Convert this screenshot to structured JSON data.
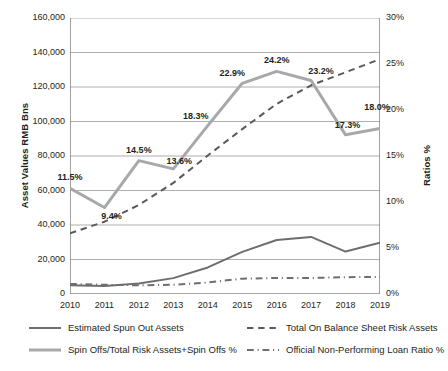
{
  "chart_data": {
    "type": "line",
    "title": "",
    "xlabel": "",
    "categories": [
      "2010",
      "2011",
      "2012",
      "2013",
      "2014",
      "2015",
      "2016",
      "2017",
      "2018",
      "2019"
    ],
    "grid": true,
    "legend_position": "bottom",
    "axes": {
      "left": {
        "label": "Asset Values RMB Bns",
        "ticks": [
          "0",
          "20,000",
          "40,000",
          "60,000",
          "80,000",
          "100,000",
          "120,000",
          "140,000",
          "160,000"
        ],
        "tick_values": [
          0,
          20000,
          40000,
          60000,
          80000,
          100000,
          120000,
          140000,
          160000
        ],
        "ylim": [
          0,
          160000
        ]
      },
      "right": {
        "label": "Ratios %",
        "ticks": [
          "0%",
          "5%",
          "10%",
          "15%",
          "20%",
          "25%",
          "30%"
        ],
        "tick_values": [
          0,
          5,
          10,
          15,
          20,
          25,
          30
        ],
        "ylim": [
          0,
          30
        ]
      }
    },
    "series": [
      {
        "name": "Estimated Spun Out Assets",
        "axis": "left",
        "style": "solid",
        "color": "#6d6e71",
        "values": [
          5100,
          4600,
          6100,
          9200,
          15400,
          24400,
          31300,
          33100,
          24600,
          29800
        ]
      },
      {
        "name": "Total On Balance Sheet Risk Assets",
        "axis": "left",
        "style": "dashed",
        "color": "#58595b",
        "values": [
          35200,
          41900,
          51600,
          64400,
          80300,
          95600,
          110200,
          121000,
          128500,
          136200
        ]
      },
      {
        "name": "Spin Offs/Total Risk Assets+Spin Offs %",
        "axis": "right",
        "style": "solid",
        "color": "#a6a8ab",
        "values": [
          11.5,
          9.4,
          14.5,
          13.6,
          18.3,
          22.9,
          24.2,
          23.2,
          17.3,
          18.0
        ],
        "data_labels": [
          "11.5%",
          "9.4%",
          "14.5%",
          "13.6%",
          "18.3%",
          "22.9%",
          "24.2%",
          "23.2%",
          "17.3%",
          "18.0%"
        ]
      },
      {
        "name": "Official Non-Performing Loan Ratio %",
        "axis": "right",
        "style": "dashdot",
        "color": "#6d6e71",
        "values": [
          1.1,
          1.0,
          0.95,
          1.0,
          1.25,
          1.67,
          1.74,
          1.74,
          1.83,
          1.86
        ]
      }
    ]
  },
  "legend": {
    "items": [
      {
        "label": "Estimated Spun Out Assets",
        "style": "solid",
        "color": "#6d6e71"
      },
      {
        "label": "Total On Balance Sheet Risk Assets",
        "style": "dashed",
        "color": "#58595b"
      },
      {
        "label": "Spin Offs/Total Risk Assets+Spin Offs %",
        "style": "solid",
        "color": "#a6a8ab"
      },
      {
        "label": "Official Non-Performing Loan Ratio %",
        "style": "dashdot",
        "color": "#6d6e71"
      }
    ]
  }
}
